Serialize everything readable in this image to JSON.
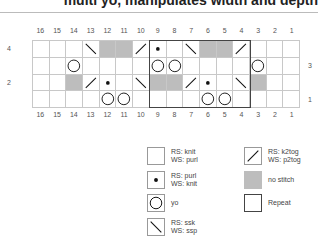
{
  "header": {
    "title": "multi yo, manipulates width and depth"
  },
  "chart": {
    "columns": [
      "16",
      "15",
      "14",
      "13",
      "12",
      "11",
      "10",
      "9",
      "8",
      "7",
      "6",
      "5",
      "4",
      "3",
      "2",
      "1"
    ],
    "row_labels": [
      {
        "label": "4",
        "side": "left",
        "row": 0
      },
      {
        "label": "3",
        "side": "right",
        "row": 1
      },
      {
        "label": "2",
        "side": "left",
        "row": 2
      },
      {
        "label": "1",
        "side": "right",
        "row": 3
      }
    ],
    "rows": [
      [
        "knit",
        "knit",
        "knit",
        "ssk",
        "nostitch",
        "nostitch",
        "k2tog",
        "purl",
        "knit",
        "ssk",
        "nostitch",
        "nostitch",
        "k2tog",
        "knit",
        "knit",
        "knit"
      ],
      [
        "knit",
        "knit",
        "yo",
        "knit",
        "knit",
        "knit",
        "knit",
        "yo",
        "yo",
        "knit",
        "knit",
        "knit",
        "knit",
        "yo",
        "knit",
        "knit"
      ],
      [
        "knit",
        "knit",
        "nostitch",
        "k2tog",
        "purl",
        "knit",
        "ssk",
        "nostitch",
        "nostitch",
        "k2tog",
        "purl",
        "knit",
        "ssk",
        "nostitch",
        "knit",
        "knit"
      ],
      [
        "knit",
        "knit",
        "knit",
        "knit",
        "yo",
        "yo",
        "knit",
        "knit",
        "knit",
        "knit",
        "yo",
        "yo",
        "knit",
        "knit",
        "knit",
        "knit"
      ]
    ],
    "repeat": {
      "from_col": "9",
      "to_col": "4",
      "rows": "1-4"
    }
  },
  "legend": {
    "knit": {
      "line1": "RS: knit",
      "line2": "WS: purl"
    },
    "purl": {
      "line1": "RS: purl",
      "line2": "WS: knit"
    },
    "yo": {
      "line1": "yo",
      "line2": ""
    },
    "ssk": {
      "line1": "RS: ssk",
      "line2": "WS: ssp"
    },
    "k2tog": {
      "line1": "RS: k2tog",
      "line2": "WS: p2tog"
    },
    "nostitch": {
      "line1": "no stitch",
      "line2": ""
    },
    "repeat": {
      "line1": "Repeat",
      "line2": ""
    }
  },
  "colors": {
    "grid_line": "#c8c8c8",
    "no_stitch": "#bdbdbd",
    "repeat_border": "#444444"
  }
}
